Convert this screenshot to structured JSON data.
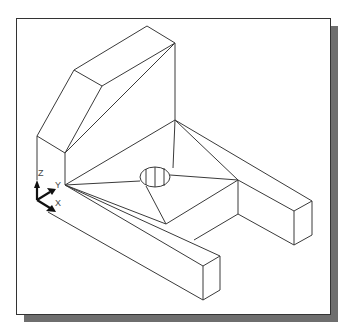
{
  "figure": {
    "colors": {
      "background": "#ffffff",
      "lines": "#3a3a3a",
      "shadow": "#6e6e6e",
      "ucs_icon": "#111111"
    }
  },
  "ucs_icon": {
    "z_label": "Z",
    "y_label": "Y",
    "x_label": "X"
  }
}
